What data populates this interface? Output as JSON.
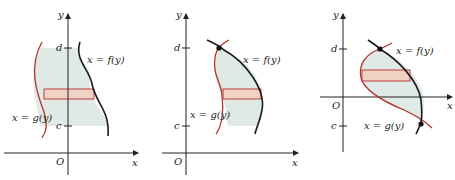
{
  "figure": {
    "colors": {
      "region_fill": "#dfe9e6",
      "strip_fill": "#f0d2c4",
      "f_curve": "#1a1a1a",
      "g_curve": "#b5302e",
      "axes": "#222222"
    },
    "panels": [
      {
        "id": "panel-1",
        "y_axis_label": "y",
        "x_axis_label": "x",
        "origin_label": "O",
        "upper_bound_label": "d",
        "lower_bound_label": "c",
        "f_label": "x = f(y)",
        "g_label": "x = g(y)",
        "intersection_points": 0
      },
      {
        "id": "panel-2",
        "y_axis_label": "y",
        "x_axis_label": "x",
        "origin_label": "O",
        "upper_bound_label": "d",
        "lower_bound_label": "c",
        "f_label": "x = f(y)",
        "g_label": "x = g(y)",
        "intersection_points": 1
      },
      {
        "id": "panel-3",
        "y_axis_label": "y",
        "x_axis_label": "x",
        "origin_label": "O",
        "upper_bound_label": "d",
        "lower_bound_label": "c",
        "f_label": "x = f(y)",
        "g_label": "x = g(y)",
        "intersection_points": 2
      }
    ]
  }
}
